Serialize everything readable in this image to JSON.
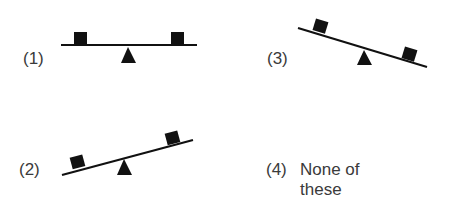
{
  "options": [
    {
      "id": 1,
      "label": "(1)",
      "state": "level"
    },
    {
      "id": 2,
      "label": "(2)",
      "state": "tilted-left-down"
    },
    {
      "id": 3,
      "label": "(3)",
      "state": "tilted-right-down"
    },
    {
      "id": 4,
      "label": "(4)",
      "text_line1": "None of",
      "text_line2": "these"
    }
  ],
  "colors": {
    "ink": "#111111",
    "text": "#3a3a3a",
    "background": "#ffffff"
  }
}
